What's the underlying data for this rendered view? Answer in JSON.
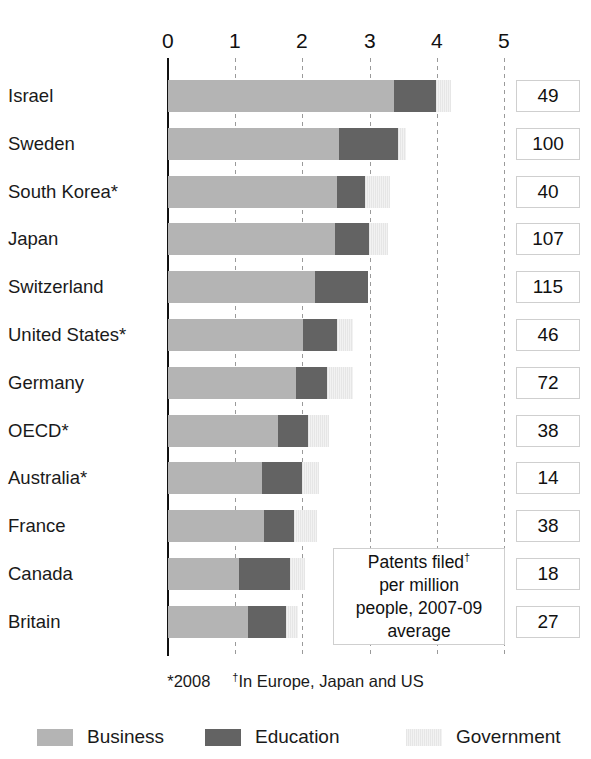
{
  "chart_data": {
    "type": "bar",
    "orientation": "horizontal",
    "stacked": true,
    "title": "",
    "xlabel": "",
    "ylabel": "",
    "xlim": [
      0,
      5
    ],
    "xticks": [
      "0",
      "1",
      "2",
      "3",
      "4",
      "5"
    ],
    "grid": true,
    "legend_position": "bottom",
    "categories": [
      "Israel",
      "Sweden",
      "South Korea*",
      "Japan",
      "Switzerland",
      "United States*",
      "Germany",
      "OECD*",
      "Australia*",
      "France",
      "Canada",
      "Britain"
    ],
    "series": [
      {
        "name": "Business",
        "color": "#b4b4b4",
        "values": [
          3.36,
          2.54,
          2.52,
          2.49,
          2.19,
          2.01,
          1.9,
          1.64,
          1.4,
          1.43,
          1.05,
          1.19
        ]
      },
      {
        "name": "Education",
        "color": "#636363",
        "values": [
          0.63,
          0.89,
          0.41,
          0.5,
          0.78,
          0.5,
          0.47,
          0.45,
          0.6,
          0.45,
          0.77,
          0.56
        ]
      },
      {
        "name": "Government",
        "color": "#ebebeb",
        "values": [
          0.22,
          0.11,
          0.38,
          0.29,
          0.0,
          0.25,
          0.38,
          0.3,
          0.24,
          0.34,
          0.22,
          0.19
        ]
      }
    ],
    "totals": [
      4.21,
      3.54,
      3.31,
      3.28,
      2.97,
      2.76,
      2.75,
      2.39,
      2.24,
      2.22,
      2.04,
      1.94
    ],
    "side_values": [
      49,
      100,
      40,
      107,
      115,
      46,
      72,
      38,
      14,
      38,
      18,
      27
    ],
    "annotations": [
      "Patents filed† per million people, 2007-09 average",
      "*2008",
      "†In Europe, Japan and US"
    ]
  },
  "axis": {
    "ticks": [
      "0",
      "1",
      "2",
      "3",
      "4",
      "5"
    ]
  },
  "rows": [
    {
      "label": "Israel",
      "value": "49"
    },
    {
      "label": "Sweden",
      "value": "100"
    },
    {
      "label": "South Korea*",
      "value": "40"
    },
    {
      "label": "Japan",
      "value": "107"
    },
    {
      "label": "Switzerland",
      "value": "115"
    },
    {
      "label": "United States*",
      "value": "46"
    },
    {
      "label": "Germany",
      "value": "72"
    },
    {
      "label": "OECD*",
      "value": "38"
    },
    {
      "label": "Australia*",
      "value": "14"
    },
    {
      "label": "France",
      "value": "38"
    },
    {
      "label": "Canada",
      "value": "18"
    },
    {
      "label": "Britain",
      "value": "27"
    }
  ],
  "callout": {
    "line1_a": "Patents filed",
    "line1_b": "†",
    "line2": "per million",
    "line3": "people, 2007-09",
    "line4": "average"
  },
  "footnotes": {
    "first": "*2008",
    "second_marker": "†",
    "second_text": "In Europe, Japan and US"
  },
  "legend": {
    "business": "Business",
    "education": "Education",
    "government": "Government"
  },
  "colors": {
    "business": "#b4b4b4",
    "education": "#636363",
    "government": "#ebebeb",
    "axis": "#111111",
    "gridline": "#9a9a9a",
    "box_border": "#cfcfcf"
  }
}
